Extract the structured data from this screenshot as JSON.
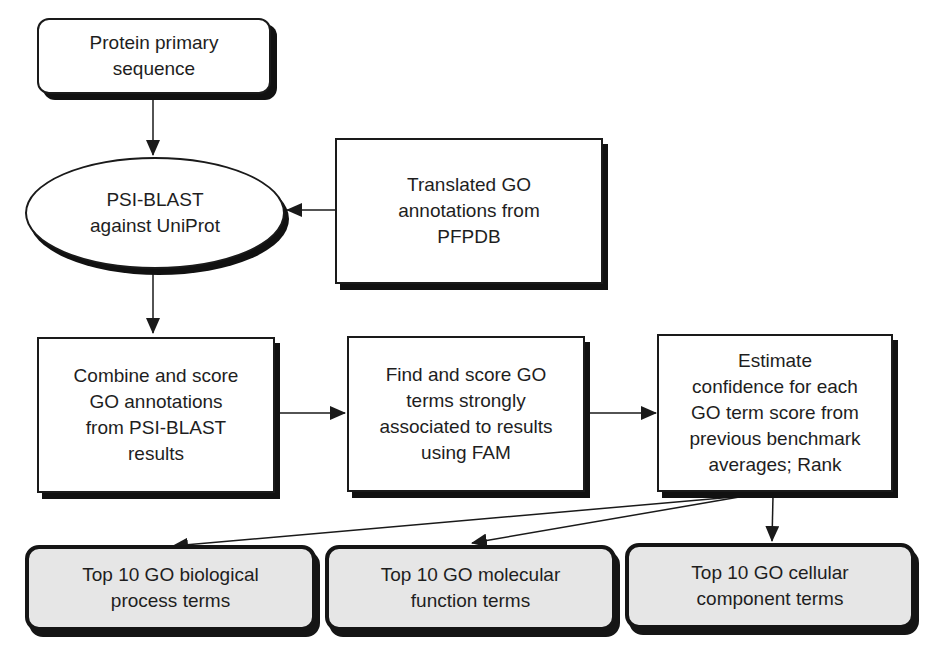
{
  "diagram": {
    "type": "flowchart",
    "nodes": {
      "input": {
        "shape": "rounded-rectangle",
        "label": "Protein primary sequence",
        "lines": [
          "Protein primary",
          "sequence"
        ]
      },
      "psiblast": {
        "shape": "ellipse",
        "label": "PSI-BLAST against UniProt",
        "lines": [
          "PSI-BLAST",
          "against UniProt"
        ]
      },
      "pfpdb": {
        "shape": "rectangle",
        "label": "Translated GO annotations from PFPDB",
        "lines": [
          "Translated GO",
          "annotations from",
          "PFPDB"
        ]
      },
      "combine": {
        "shape": "rectangle",
        "label": "Combine and score GO annotations from PSI-BLAST results",
        "lines": [
          "Combine and score",
          "GO annotations",
          "from PSI-BLAST",
          "results"
        ]
      },
      "fam": {
        "shape": "rectangle",
        "label": "Find and score GO terms strongly associated to results using FAM",
        "lines": [
          "Find and score GO",
          "terms strongly",
          "associated to results",
          "using FAM"
        ]
      },
      "estimate": {
        "shape": "rectangle",
        "label": "Estimate confidence for each GO term score from previous benchmark averages; Rank",
        "lines": [
          "Estimate",
          "confidence for each",
          "GO term score from",
          "previous benchmark",
          "averages; Rank"
        ]
      },
      "bp": {
        "shape": "rounded-rectangle-shaded",
        "label": "Top 10 GO biological process terms",
        "lines": [
          "Top 10 GO biological",
          "process terms"
        ]
      },
      "mf": {
        "shape": "rounded-rectangle-shaded",
        "label": "Top 10 GO molecular function terms",
        "lines": [
          "Top 10 GO molecular",
          "function terms"
        ]
      },
      "cc": {
        "shape": "rounded-rectangle-shaded",
        "label": "Top 10 GO cellular component terms",
        "lines": [
          "Top 10 GO cellular",
          "component terms"
        ]
      }
    },
    "edges": [
      {
        "from": "input",
        "to": "psiblast"
      },
      {
        "from": "pfpdb",
        "to": "psiblast"
      },
      {
        "from": "psiblast",
        "to": "combine"
      },
      {
        "from": "combine",
        "to": "fam"
      },
      {
        "from": "fam",
        "to": "estimate"
      },
      {
        "from": "estimate",
        "to": "bp"
      },
      {
        "from": "estimate",
        "to": "mf"
      },
      {
        "from": "estimate",
        "to": "cc"
      }
    ],
    "colors": {
      "stroke": "#1a1a1a",
      "fill": "#ffffff",
      "output_fill": "#e6e6e6"
    }
  }
}
